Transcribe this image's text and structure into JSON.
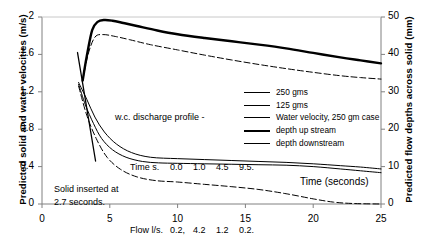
{
  "chart_data": {
    "type": "line",
    "title": "",
    "xlabel": "Time (seconds)",
    "ylabel": "Predicted solid and water velocities (m/s)",
    "y2label": "Predicted flow depths across solid (mm)",
    "xlim": [
      0,
      25
    ],
    "ylim": [
      0,
      2
    ],
    "y2lim": [
      0,
      50
    ],
    "grid": false,
    "legend_position": "inside-right",
    "x_ticks": [
      "0",
      "5",
      "10",
      "15",
      "20",
      "25"
    ],
    "y_ticks": [
      "0",
      "0.4",
      "0.8",
      "1.2",
      "1.6",
      "2"
    ],
    "y2_ticks": [
      "0",
      "10",
      "20",
      "30",
      "40",
      "50"
    ],
    "series": [
      {
        "name": "250 gms",
        "style": "thin-solid",
        "axis": "left",
        "x": [
          2.7,
          3.2,
          3.8,
          4.4,
          5.2,
          6.2,
          7.4,
          8.6,
          10.0,
          12.0,
          14.0,
          16.0,
          18.0,
          20.0,
          22.0,
          23.5,
          25.0
        ],
        "y": [
          1.28,
          1.06,
          0.86,
          0.7,
          0.58,
          0.5,
          0.455,
          0.44,
          0.435,
          0.43,
          0.425,
          0.42,
          0.415,
          0.4,
          0.375,
          0.355,
          0.335
        ]
      },
      {
        "name": "125 gms",
        "style": "dash-dot",
        "axis": "left",
        "x": [
          2.7,
          3.3,
          4.0,
          4.8,
          5.8,
          7.0,
          8.4,
          10.0,
          12.0,
          14.0,
          16.0,
          18.0,
          20.0,
          21.5,
          23.0,
          25.0
        ],
        "y": [
          1.26,
          0.95,
          0.7,
          0.5,
          0.37,
          0.29,
          0.25,
          0.235,
          0.21,
          0.185,
          0.155,
          0.11,
          0.055,
          0.02,
          0.005,
          0.0
        ]
      },
      {
        "name": "Water velocity, 250 gm case",
        "style": "thin-solid",
        "axis": "left",
        "x": [
          2.7,
          3.3,
          3.9,
          4.6,
          5.5,
          6.6,
          8.0,
          10.0,
          12.0,
          14.0,
          16.0,
          18.0,
          20.0,
          22.0,
          23.5,
          25.0
        ],
        "y": [
          1.3,
          1.12,
          0.93,
          0.77,
          0.64,
          0.55,
          0.5,
          0.485,
          0.475,
          0.465,
          0.455,
          0.445,
          0.43,
          0.41,
          0.395,
          0.375
        ]
      },
      {
        "name": "depth up stream",
        "style": "thick-solid",
        "axis": "right",
        "x": [
          3.0,
          3.3,
          3.7,
          4.1,
          4.6,
          5.2,
          6.0,
          7.0,
          8.5,
          10.0,
          12.0,
          14.0,
          16.0,
          18.0,
          20.0,
          22.0,
          23.5,
          25.0
        ],
        "y": [
          33.0,
          39.5,
          46.5,
          48.7,
          49.2,
          49.0,
          48.4,
          47.6,
          46.4,
          45.4,
          44.4,
          43.5,
          42.6,
          41.6,
          40.4,
          39.2,
          38.4,
          37.6
        ]
      },
      {
        "name": "depth downstream",
        "style": "dash-dot",
        "axis": "right",
        "x": [
          3.0,
          3.4,
          3.9,
          4.5,
          5.4,
          6.5,
          8.0,
          10.0,
          12.0,
          14.0,
          16.0,
          18.0,
          20.0,
          22.0,
          23.5,
          25.0
        ],
        "y": [
          33.0,
          40.0,
          44.6,
          45.3,
          44.8,
          43.9,
          42.6,
          41.2,
          39.8,
          38.5,
          37.3,
          36.2,
          35.2,
          34.3,
          33.8,
          33.4
        ]
      },
      {
        "name": "solid insertion marker",
        "style": "thin-solid-marker",
        "axis": "left",
        "x": [
          2.62,
          3.95
        ],
        "y": [
          1.62,
          0.46
        ]
      }
    ],
    "annotations": {
      "discharge_title": "w.c. discharge profile -",
      "time_label": "Time s.",
      "time_values": [
        "0.0",
        "1.0",
        "4.5",
        "9.5."
      ],
      "flow_label": "Flow l/s.",
      "flow_values": [
        "0.2,",
        "4.2",
        "1.2",
        "0.2."
      ],
      "solid_note_line1": "Solid inserted at",
      "solid_note_line2": "2.7 seconds.",
      "time_axis_note": "Time (seconds)"
    },
    "legend": [
      {
        "label": "250 gms",
        "style": "thin-solid"
      },
      {
        "label": "125 gms",
        "style": "dash-dot"
      },
      {
        "label": "Water velocity, 250 gm case",
        "style": "thin-solid"
      },
      {
        "label": "depth up stream",
        "style": "thick-solid"
      },
      {
        "label": "depth downstream",
        "style": "dash-dot"
      }
    ],
    "colors": {
      "line": "#000000",
      "axis": "#808080",
      "background": "#ffffff"
    }
  }
}
